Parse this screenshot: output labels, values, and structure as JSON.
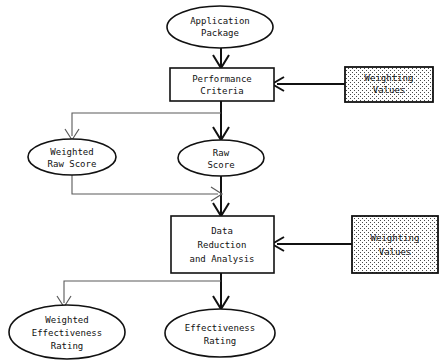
{
  "diagram": {
    "background_color": "#ffffff",
    "line_color": "#111111",
    "thin_line_color": "#5a5a5a",
    "text_color": "#111111",
    "nodes": [
      {
        "id": "application-package",
        "shape": "ellipse",
        "lines": [
          "Application",
          "Package"
        ],
        "line1": "Application",
        "line2": "Package",
        "cx": 220,
        "cy": 27,
        "rx": 53,
        "ry": 21
      },
      {
        "id": "performance-criteria",
        "shape": "rect",
        "lines": [
          "Performance",
          "Criteria"
        ],
        "line1": "Performance",
        "line2": "Criteria",
        "x": 170,
        "y": 68,
        "w": 104,
        "h": 33
      },
      {
        "id": "weighting-values-top",
        "shape": "rect-stippled",
        "lines": [
          "Weighting",
          "Values"
        ],
        "line1": "Weighting",
        "line2": "Values",
        "x": 345,
        "y": 67,
        "w": 88,
        "h": 35
      },
      {
        "id": "weighted-raw-score",
        "shape": "ellipse",
        "lines": [
          "Weighted",
          "Raw Score"
        ],
        "line1": "Weighted",
        "line2": "Raw Score",
        "cx": 72,
        "cy": 157,
        "rx": 44,
        "ry": 18
      },
      {
        "id": "raw-score",
        "shape": "ellipse",
        "lines": [
          "Raw",
          "Score"
        ],
        "line1": "Raw",
        "line2": "Score",
        "cx": 221,
        "cy": 158,
        "rx": 43,
        "ry": 18
      },
      {
        "id": "data-reduction-and-analysis",
        "shape": "rect",
        "lines": [
          "Data",
          "Reduction",
          "and Analysis"
        ],
        "line1": "Data",
        "line2": "Reduction",
        "line3": "and Analysis",
        "x": 171,
        "y": 216,
        "w": 103,
        "h": 57
      },
      {
        "id": "weighting-values-bottom",
        "shape": "rect-stippled",
        "lines": [
          "Weighting",
          "Values"
        ],
        "line1": "Weighting",
        "line2": "Values",
        "x": 352,
        "y": 216,
        "w": 86,
        "h": 57
      },
      {
        "id": "weighted-effectiveness-rating",
        "shape": "ellipse",
        "lines": [
          "Weighted",
          "Effectiveness",
          "Rating"
        ],
        "line1": "Weighted",
        "line2": "Effectiveness",
        "line3": "Rating",
        "cx": 67,
        "cy": 332,
        "rx": 58,
        "ry": 27
      },
      {
        "id": "effectiveness-rating",
        "shape": "ellipse",
        "lines": [
          "Effectiveness",
          "Rating"
        ],
        "line1": "Effectiveness",
        "line2": "Rating",
        "cx": 220,
        "cy": 333,
        "rx": 55,
        "ry": 24
      }
    ],
    "edges": [
      {
        "id": "app-to-criteria",
        "from": "application-package",
        "to": "performance-criteria",
        "style": "thick",
        "direction": "down"
      },
      {
        "id": "weighting-top-to-criteria",
        "from": "weighting-values-top",
        "to": "performance-criteria",
        "style": "thick",
        "direction": "left"
      },
      {
        "id": "criteria-to-raw-score",
        "from": "performance-criteria",
        "to": "raw-score",
        "style": "thick",
        "direction": "down"
      },
      {
        "id": "criteria-to-weighted-raw-score",
        "from": "performance-criteria",
        "to": "weighted-raw-score",
        "style": "thin",
        "direction": "left-down"
      },
      {
        "id": "raw-score-to-data-reduction",
        "from": "raw-score",
        "to": "data-reduction-and-analysis",
        "style": "thick",
        "direction": "down"
      },
      {
        "id": "weighted-raw-score-to-data-reduction",
        "from": "weighted-raw-score",
        "to": "data-reduction-and-analysis",
        "style": "thin",
        "direction": "down-right"
      },
      {
        "id": "weighting-bottom-to-data-reduction",
        "from": "weighting-values-bottom",
        "to": "data-reduction-and-analysis",
        "style": "thick",
        "direction": "left"
      },
      {
        "id": "data-reduction-to-effectiveness-rating",
        "from": "data-reduction-and-analysis",
        "to": "effectiveness-rating",
        "style": "thick",
        "direction": "down"
      },
      {
        "id": "data-reduction-to-weighted-effectiveness-rating",
        "from": "data-reduction-and-analysis",
        "to": "weighted-effectiveness-rating",
        "style": "thin",
        "direction": "left-down"
      }
    ]
  }
}
